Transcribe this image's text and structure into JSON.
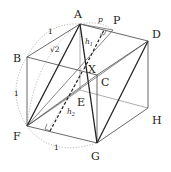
{
  "figure": {
    "type": "cube-geometry-diagram",
    "vertices": {
      "A": {
        "label": "A",
        "x": 80,
        "y": 24,
        "lx": 74,
        "ly": 18
      },
      "B": {
        "label": "B",
        "x": 27,
        "y": 57,
        "lx": 13,
        "ly": 62
      },
      "C": {
        "label": "C",
        "x": 97,
        "y": 75,
        "lx": 101,
        "ly": 86
      },
      "D": {
        "label": "D",
        "x": 148,
        "y": 41,
        "lx": 152,
        "ly": 38
      },
      "E": {
        "label": "E",
        "x": 80,
        "y": 90,
        "lx": 77,
        "ly": 106
      },
      "F": {
        "label": "F",
        "x": 27,
        "y": 126,
        "lx": 13,
        "ly": 140
      },
      "G": {
        "label": "G",
        "x": 97,
        "y": 143,
        "lx": 91,
        "ly": 160
      },
      "H": {
        "label": "H",
        "x": 148,
        "y": 108,
        "lx": 152,
        "ly": 124
      },
      "P": {
        "label": "P",
        "x": 113,
        "y": 30,
        "lx": 113,
        "ly": 24
      },
      "X": {
        "label": "X",
        "x": 84,
        "y": 69,
        "lx": 88,
        "ly": 73
      }
    },
    "annotations": {
      "p": "p",
      "h1": "h",
      "h1_sub": "1",
      "h2": "h",
      "h2_sub": "2",
      "sqrt2": "√2",
      "one_top": "1",
      "one_left": "1",
      "one_bottom": "1"
    }
  }
}
